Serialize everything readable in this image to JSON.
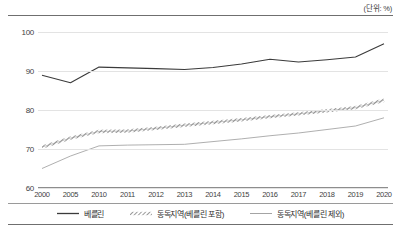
{
  "unit_label": "(단위: %)",
  "chart_data": {
    "type": "line",
    "title": "",
    "xlabel": "",
    "ylabel": "",
    "unit": "%",
    "grid": true,
    "legend_position": "bottom",
    "ylim": [
      60,
      100
    ],
    "yticks": [
      60,
      70,
      80,
      90,
      100
    ],
    "categories": [
      "2000",
      "2005",
      "2010",
      "2011",
      "2012",
      "2013",
      "2014",
      "2015",
      "2016",
      "2017",
      "2018",
      "2019",
      "2020"
    ],
    "series": [
      {
        "name": "베를린",
        "style": "solid",
        "color": "#3b3b3b",
        "values": [
          88.9,
          87.0,
          91.0,
          90.8,
          90.6,
          90.4,
          90.9,
          91.8,
          93.0,
          92.3,
          92.9,
          93.6,
          97.0
        ]
      },
      {
        "name": "동독지역(베를린 포함)",
        "style": "hatched",
        "color": "#707070",
        "values": [
          70.5,
          72.8,
          74.5,
          74.6,
          75.3,
          76.1,
          76.8,
          77.5,
          78.3,
          79.0,
          79.8,
          80.6,
          82.5
        ]
      },
      {
        "name": "동독지역(베를린 제외)",
        "style": "thin-solid",
        "color": "#9a9a9a",
        "values": [
          65.0,
          68.2,
          70.8,
          71.0,
          71.1,
          71.2,
          71.9,
          72.6,
          73.4,
          74.1,
          75.0,
          75.9,
          78.0
        ]
      }
    ]
  },
  "legend": [
    {
      "label": "베를린"
    },
    {
      "label": "동독지역(베를린 포함)"
    },
    {
      "label": "동독지역(베를린 제외)"
    }
  ]
}
